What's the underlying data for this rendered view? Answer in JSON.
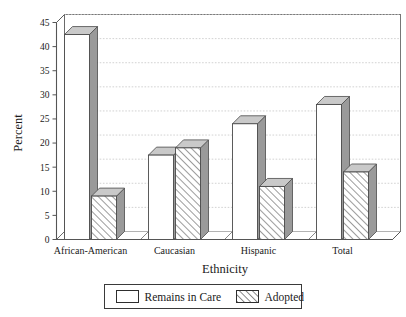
{
  "chart_data": {
    "type": "bar",
    "title": "",
    "subtitle": "",
    "xlabel": "Ethnicity",
    "ylabel": "Percent",
    "ylim": [
      0,
      45
    ],
    "ytick_step": 5,
    "yticks": [
      "0",
      "5",
      "10",
      "15",
      "20",
      "25",
      "30",
      "35",
      "40",
      "45"
    ],
    "grid": true,
    "grid_axis": "y",
    "legend_position": "bottom",
    "style": "3d-grouped-bars",
    "categories": [
      "African-American",
      "Caucasian",
      "Hispanic",
      "Total"
    ],
    "series": [
      {
        "name": "Remains in Care",
        "fill": "white",
        "pattern": "solid",
        "values": [
          42.5,
          17.5,
          24,
          28
        ]
      },
      {
        "name": "Adopted",
        "fill": "white",
        "pattern": "diagonal-hatch",
        "values": [
          9,
          19,
          11,
          14
        ]
      }
    ],
    "colors": {
      "bar_face": "#ffffff",
      "bar_side": "#9a9a9a",
      "bar_top": "#c9c9c9",
      "bar_outline": "#4a4a4a",
      "grid": "#c6c6c6",
      "axis": "#555555",
      "text": "#1a1a1a"
    }
  },
  "legend": {
    "items": [
      {
        "label": "Remains in Care",
        "pattern": "solid"
      },
      {
        "label": "Adopted",
        "pattern": "diagonal-hatch"
      }
    ]
  }
}
